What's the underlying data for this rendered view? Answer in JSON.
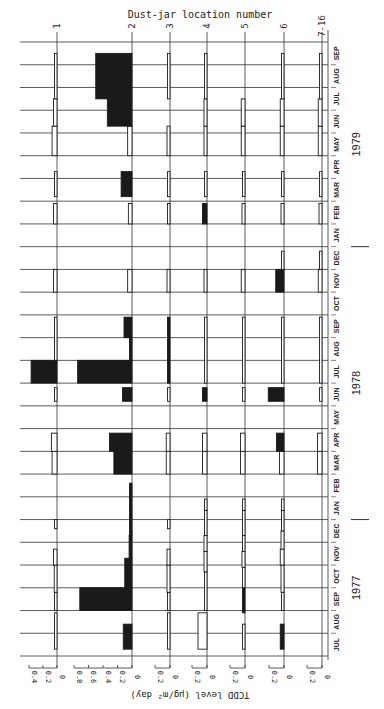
{
  "chart_data": {
    "type": "bar",
    "orientation": "rotated-90-clockwise",
    "title": "",
    "xlabel": "",
    "ylabel": "TCDD level (µg/m² day)",
    "panel_axis_label": "Dust-jar location number",
    "years": [
      {
        "label": "1977",
        "months": [
          "JUL",
          "AUG",
          "SEP",
          "OCT",
          "NOV",
          "DEC"
        ]
      },
      {
        "label": "1978",
        "months": [
          "JAN",
          "FEB",
          "MAR",
          "APR",
          "MAY",
          "JUN",
          "JUL",
          "AUG",
          "SEP",
          "OCT",
          "NOV",
          "DEC"
        ]
      },
      {
        "label": "1979",
        "months": [
          "JAN",
          "FEB",
          "MAR",
          "APR",
          "MAY",
          "JUN",
          "JUL",
          "AUG",
          "SEP"
        ]
      }
    ],
    "months": [
      "JUL",
      "AUG",
      "SEP",
      "OCT",
      "NOV",
      "DEC",
      "JAN",
      "FEB",
      "MAR",
      "APR",
      "MAY",
      "JUN",
      "JUL",
      "AUG",
      "SEP",
      "OCT",
      "NOV",
      "DEC",
      "JAN",
      "FEB",
      "MAR",
      "APR",
      "MAY",
      "JUN",
      "JUL",
      "AUG",
      "SEP"
    ],
    "legend": {
      "filled": "TCDD detected",
      "open": "below detection limit"
    },
    "panels": [
      {
        "name": "1",
        "tick_labels": [
          "0",
          "0.2",
          "0.4"
        ],
        "ylim": [
          0,
          0.4
        ],
        "bars": [
          {
            "start": 0.3,
            "end": 1.9,
            "value": 0.02,
            "filled": false
          },
          {
            "start": 2.0,
            "end": 2.8,
            "value": 0.02,
            "filled": false
          },
          {
            "start": 2.8,
            "end": 4.0,
            "value": 0.04,
            "filled": false
          },
          {
            "start": 4.0,
            "end": 4.7,
            "value": 0.05,
            "filled": false
          },
          {
            "start": 5.6,
            "end": 6.0,
            "value": 0.03,
            "filled": false
          },
          {
            "start": 8.0,
            "end": 9.0,
            "value": 0.07,
            "filled": false
          },
          {
            "start": 9.0,
            "end": 9.8,
            "value": 0.08,
            "filled": false
          },
          {
            "start": 11.2,
            "end": 11.8,
            "value": 0.03,
            "filled": false
          },
          {
            "start": 12.0,
            "end": 13.0,
            "value": 0.37,
            "filled": true
          },
          {
            "start": 13.0,
            "end": 14.9,
            "value": 0.02,
            "filled": false
          },
          {
            "start": 16.0,
            "end": 17.0,
            "value": 0.05,
            "filled": false
          },
          {
            "start": 19.0,
            "end": 19.9,
            "value": 0.05,
            "filled": false
          },
          {
            "start": 20.2,
            "end": 21.3,
            "value": 0.03,
            "filled": false
          },
          {
            "start": 22.0,
            "end": 23.3,
            "value": 0.07,
            "filled": false
          },
          {
            "start": 23.3,
            "end": 24.5,
            "value": 0.05,
            "filled": false
          },
          {
            "start": 24.5,
            "end": 26.5,
            "value": 0.02,
            "filled": false
          }
        ]
      },
      {
        "name": "2",
        "tick_labels": [
          "0",
          "0.2",
          "0.4",
          "0.6",
          "0.8"
        ],
        "ylim": [
          0,
          0.8
        ],
        "bars": [
          {
            "start": 0.3,
            "end": 1.4,
            "value": 0.12,
            "filled": true
          },
          {
            "start": 2.0,
            "end": 3.0,
            "value": 0.72,
            "filled": true
          },
          {
            "start": 3.0,
            "end": 4.3,
            "value": 0.1,
            "filled": true
          },
          {
            "start": 4.3,
            "end": 5.3,
            "value": 0.04,
            "filled": true
          },
          {
            "start": 5.3,
            "end": 7.6,
            "value": 0.03,
            "filled": true
          },
          {
            "start": 8.0,
            "end": 9.0,
            "value": 0.25,
            "filled": true
          },
          {
            "start": 9.0,
            "end": 9.8,
            "value": 0.31,
            "filled": true
          },
          {
            "start": 11.2,
            "end": 11.8,
            "value": 0.13,
            "filled": true
          },
          {
            "start": 12.0,
            "end": 13.0,
            "value": 0.75,
            "filled": true
          },
          {
            "start": 13.0,
            "end": 14.0,
            "value": 0.02,
            "filled": true
          },
          {
            "start": 14.0,
            "end": 14.9,
            "value": 0.11,
            "filled": true
          },
          {
            "start": 16.0,
            "end": 17.0,
            "value": 0.06,
            "filled": false
          },
          {
            "start": 19.0,
            "end": 19.9,
            "value": 0.05,
            "filled": false
          },
          {
            "start": 20.2,
            "end": 21.3,
            "value": 0.15,
            "filled": true
          },
          {
            "start": 22.0,
            "end": 23.3,
            "value": 0.06,
            "filled": false
          },
          {
            "start": 23.3,
            "end": 24.5,
            "value": 0.34,
            "filled": true
          },
          {
            "start": 24.5,
            "end": 26.5,
            "value": 0.5,
            "filled": true
          }
        ]
      },
      {
        "name": "3",
        "tick_labels": [
          "0",
          "0.2"
        ],
        "ylim": [
          0,
          0.2
        ],
        "bars": [
          {
            "start": 0.3,
            "end": 1.9,
            "value": 0.02,
            "filled": false
          },
          {
            "start": 2.0,
            "end": 2.8,
            "value": 0.02,
            "filled": false
          },
          {
            "start": 2.8,
            "end": 4.0,
            "value": 0.04,
            "filled": false
          },
          {
            "start": 4.0,
            "end": 4.7,
            "value": 0.04,
            "filled": false
          },
          {
            "start": 5.6,
            "end": 6.0,
            "value": 0.02,
            "filled": false
          },
          {
            "start": 8.0,
            "end": 9.0,
            "value": 0.05,
            "filled": false
          },
          {
            "start": 9.0,
            "end": 9.8,
            "value": 0.05,
            "filled": false
          },
          {
            "start": 11.2,
            "end": 11.8,
            "value": 0.02,
            "filled": false
          },
          {
            "start": 12.0,
            "end": 14.9,
            "value": 0.01,
            "filled": true
          },
          {
            "start": 16.0,
            "end": 17.0,
            "value": 0.04,
            "filled": false
          },
          {
            "start": 19.0,
            "end": 19.9,
            "value": 0.02,
            "filled": false
          },
          {
            "start": 20.2,
            "end": 21.3,
            "value": 0.01,
            "filled": false
          },
          {
            "start": 22.0,
            "end": 23.3,
            "value": 0.04,
            "filled": false
          },
          {
            "start": 24.5,
            "end": 26.5,
            "value": 0.02,
            "filled": false
          }
        ]
      },
      {
        "name": "4",
        "tick_labels": [
          "0",
          "0.2"
        ],
        "ylim": [
          0,
          0.2
        ],
        "bars": [
          {
            "start": 0.3,
            "end": 1.9,
            "value": 0.12,
            "filled": false
          },
          {
            "start": 2.0,
            "end": 3.7,
            "value": 0.02,
            "filled": false
          },
          {
            "start": 3.7,
            "end": 4.6,
            "value": 0.04,
            "filled": false
          },
          {
            "start": 4.6,
            "end": 5.3,
            "value": 0.04,
            "filled": false
          },
          {
            "start": 5.3,
            "end": 6.4,
            "value": 0.02,
            "filled": false
          },
          {
            "start": 6.4,
            "end": 6.9,
            "value": 0.02,
            "filled": false
          },
          {
            "start": 8.0,
            "end": 9.0,
            "value": 0.06,
            "filled": false
          },
          {
            "start": 9.0,
            "end": 9.8,
            "value": 0.06,
            "filled": false
          },
          {
            "start": 11.2,
            "end": 11.8,
            "value": 0.06,
            "filled": true
          },
          {
            "start": 12.0,
            "end": 14.9,
            "value": 0.01,
            "filled": false
          },
          {
            "start": 16.0,
            "end": 17.0,
            "value": 0.04,
            "filled": false
          },
          {
            "start": 19.0,
            "end": 19.9,
            "value": 0.06,
            "filled": true
          },
          {
            "start": 20.2,
            "end": 21.3,
            "value": 0.01,
            "filled": false
          },
          {
            "start": 22.0,
            "end": 23.3,
            "value": 0.04,
            "filled": false
          },
          {
            "start": 23.3,
            "end": 24.5,
            "value": 0.04,
            "filled": false
          },
          {
            "start": 24.5,
            "end": 26.5,
            "value": 0.01,
            "filled": false
          }
        ]
      },
      {
        "name": "5",
        "tick_labels": [
          "0",
          "0.2"
        ],
        "ylim": [
          0,
          0.2
        ],
        "bars": [
          {
            "start": 0.3,
            "end": 1.4,
            "value": 0.01,
            "filled": false
          },
          {
            "start": 1.9,
            "end": 3.0,
            "value": 0.02,
            "filled": true
          },
          {
            "start": 3.0,
            "end": 3.9,
            "value": 0.02,
            "filled": false
          },
          {
            "start": 3.9,
            "end": 4.6,
            "value": 0.04,
            "filled": false
          },
          {
            "start": 4.6,
            "end": 5.3,
            "value": 0.03,
            "filled": false
          },
          {
            "start": 5.3,
            "end": 6.4,
            "value": 0.02,
            "filled": false
          },
          {
            "start": 6.4,
            "end": 6.9,
            "value": 0.02,
            "filled": false
          },
          {
            "start": 8.0,
            "end": 9.0,
            "value": 0.06,
            "filled": false
          },
          {
            "start": 9.0,
            "end": 9.8,
            "value": 0.06,
            "filled": false
          },
          {
            "start": 11.2,
            "end": 11.8,
            "value": 0.03,
            "filled": false
          },
          {
            "start": 12.0,
            "end": 14.9,
            "value": 0.01,
            "filled": false
          },
          {
            "start": 16.0,
            "end": 17.0,
            "value": 0.05,
            "filled": false
          },
          {
            "start": 19.0,
            "end": 19.9,
            "value": 0.04,
            "filled": false
          },
          {
            "start": 20.2,
            "end": 21.3,
            "value": 0.02,
            "filled": false
          },
          {
            "start": 22.0,
            "end": 23.3,
            "value": 0.05,
            "filled": false
          },
          {
            "start": 23.3,
            "end": 24.5,
            "value": 0.05,
            "filled": false
          }
        ]
      },
      {
        "name": "6",
        "tick_labels": [
          "0",
          "0.2"
        ],
        "ylim": [
          0,
          0.2
        ],
        "bars": [
          {
            "start": 0.3,
            "end": 1.4,
            "value": 0.05,
            "filled": true
          },
          {
            "start": 2.0,
            "end": 2.8,
            "value": 0.03,
            "filled": false
          },
          {
            "start": 2.8,
            "end": 4.0,
            "value": 0.04,
            "filled": false
          },
          {
            "start": 4.0,
            "end": 4.7,
            "value": 0.05,
            "filled": false
          },
          {
            "start": 4.7,
            "end": 5.5,
            "value": 0.04,
            "filled": false
          },
          {
            "start": 5.5,
            "end": 6.4,
            "value": 0.02,
            "filled": false
          },
          {
            "start": 6.4,
            "end": 6.9,
            "value": 0.02,
            "filled": false
          },
          {
            "start": 8.0,
            "end": 9.0,
            "value": 0.06,
            "filled": false
          },
          {
            "start": 9.0,
            "end": 9.8,
            "value": 0.1,
            "filled": true
          },
          {
            "start": 11.2,
            "end": 11.8,
            "value": 0.21,
            "filled": true
          },
          {
            "start": 12.0,
            "end": 14.9,
            "value": 0.01,
            "filled": false
          },
          {
            "start": 16.0,
            "end": 17.0,
            "value": 0.11,
            "filled": true
          },
          {
            "start": 17.0,
            "end": 17.8,
            "value": 0.03,
            "filled": false
          },
          {
            "start": 19.0,
            "end": 19.9,
            "value": 0.04,
            "filled": false
          },
          {
            "start": 20.2,
            "end": 21.3,
            "value": 0.01,
            "filled": false
          },
          {
            "start": 22.0,
            "end": 23.3,
            "value": 0.05,
            "filled": false
          },
          {
            "start": 23.3,
            "end": 24.5,
            "value": 0.05,
            "filled": false
          },
          {
            "start": 24.5,
            "end": 26.5,
            "value": 0.02,
            "filled": false
          }
        ]
      },
      {
        "name": "7-16",
        "tick_labels": [
          "0",
          "0.2"
        ],
        "ylim": [
          0,
          0.2
        ],
        "bars": [
          {
            "start": 8.0,
            "end": 9.0,
            "value": 0.06,
            "filled": false
          },
          {
            "start": 9.0,
            "end": 9.8,
            "value": 0.06,
            "filled": false
          },
          {
            "start": 11.2,
            "end": 11.8,
            "value": 0.03,
            "filled": false
          },
          {
            "start": 12.0,
            "end": 14.9,
            "value": 0.01,
            "filled": false
          },
          {
            "start": 16.0,
            "end": 17.0,
            "value": 0.05,
            "filled": false
          },
          {
            "start": 17.0,
            "end": 17.8,
            "value": 0.03,
            "filled": false
          },
          {
            "start": 19.0,
            "end": 19.9,
            "value": 0.04,
            "filled": false
          },
          {
            "start": 20.2,
            "end": 21.3,
            "value": 0.01,
            "filled": false
          },
          {
            "start": 22.0,
            "end": 23.3,
            "value": 0.05,
            "filled": false
          },
          {
            "start": 23.3,
            "end": 24.5,
            "value": 0.05,
            "filled": false
          },
          {
            "start": 24.5,
            "end": 26.5,
            "value": 0.02,
            "filled": false
          }
        ]
      }
    ],
    "grid": true
  },
  "labels": {
    "panel_axis_title": "Dust-jar location number",
    "value_axis_title": "TCDD level (µg/m² day)"
  }
}
